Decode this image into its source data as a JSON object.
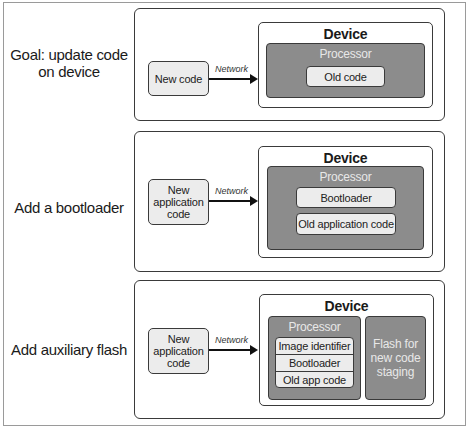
{
  "rows": [
    {
      "label": "Goal: update code on device",
      "label_lines": [
        "Goal: update code",
        "on device"
      ],
      "source": "New code",
      "network_label": "Network",
      "device": {
        "title": "Device",
        "processor": {
          "title": "Processor",
          "items": [
            "Old code"
          ]
        }
      }
    },
    {
      "label": "Add a bootloader",
      "source_lines": [
        "New",
        "application",
        "code"
      ],
      "network_label": "Network",
      "device": {
        "title": "Device",
        "processor": {
          "title": "Processor",
          "items": [
            "Bootloader",
            "Old application code"
          ]
        }
      }
    },
    {
      "label": "Add auxiliary flash",
      "source_lines": [
        "New",
        "application",
        "code"
      ],
      "network_label": "Network",
      "device": {
        "title": "Device",
        "processor": {
          "title": "Processor",
          "stack": [
            "Image identifier",
            "Bootloader",
            "Old app code"
          ]
        },
        "flash_lines": [
          "Flash for",
          "new code",
          "staging"
        ]
      }
    }
  ],
  "colors": {
    "processor_fill": "#8c8c8c",
    "box_fill": "#ececec",
    "stroke": "#3a3a3a"
  }
}
